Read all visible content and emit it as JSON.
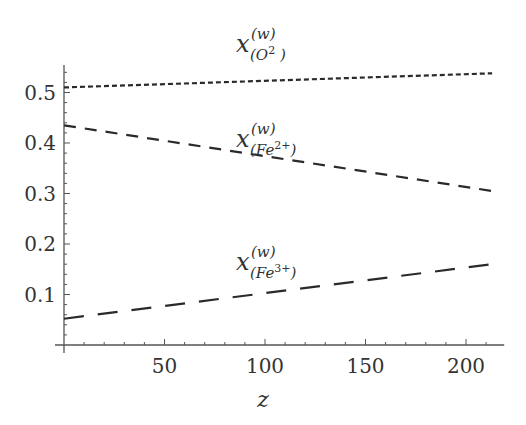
{
  "chart_data": {
    "type": "line",
    "title": "",
    "xlabel": "z",
    "ylabel": "",
    "xlim": [
      0,
      219
    ],
    "ylim": [
      0,
      0.55
    ],
    "x_ticks": [
      50,
      100,
      150,
      200
    ],
    "x_tick_labels": [
      "50",
      "100",
      "150",
      "200"
    ],
    "y_ticks": [
      0.1,
      0.2,
      0.3,
      0.4,
      0.5
    ],
    "y_tick_labels": [
      "0.1",
      "0.2",
      "0.3",
      "0.4",
      "0.5"
    ],
    "grid": false,
    "legend": "inline labels near each curve",
    "x": [
      0,
      213
    ],
    "series": [
      {
        "name": "x^(w)_(O2-)",
        "label_main": "x",
        "label_sup": "(w)",
        "label_sub": "(O",
        "label_sub_sup": "2",
        "label_sub_end": "  )",
        "style": "short-dash",
        "values": [
          0.51,
          0.538
        ]
      },
      {
        "name": "x^(w)_(Fe2+)",
        "label_main": "x",
        "label_sup": "(w)",
        "label_sub": "(Fe",
        "label_sub_sup": "2+",
        "label_sub_end": ")",
        "style": "medium-dash",
        "values": [
          0.435,
          0.305
        ]
      },
      {
        "name": "x^(w)_(Fe3+)",
        "label_main": "x",
        "label_sup": "(w)",
        "label_sub": "(Fe",
        "label_sub_sup": "3+",
        "label_sub_end": ")",
        "style": "long-dash",
        "values": [
          0.052,
          0.16
        ]
      }
    ]
  }
}
